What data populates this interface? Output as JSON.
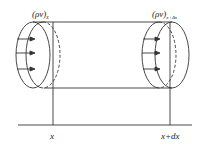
{
  "diagram": {
    "title": "",
    "labels": {
      "flux_in": "(ρv)",
      "flux_in_sub": "x",
      "flux_out": "(ρv)",
      "flux_out_sub": "x+Δx",
      "axis_left": "x",
      "axis_right": "x+dx"
    },
    "colors": {
      "stroke": "#333333",
      "background": "#ffffff"
    },
    "arrows": {
      "left_count": 3,
      "right_count": 3
    }
  }
}
